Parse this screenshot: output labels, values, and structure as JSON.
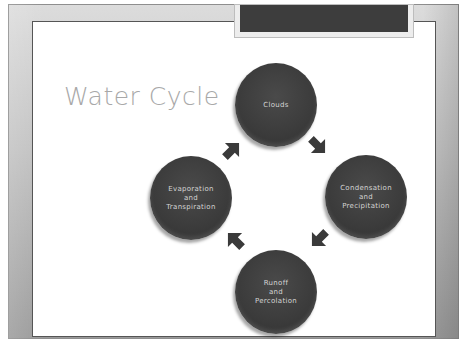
{
  "slide": {
    "title": "Water Cycle",
    "colors": {
      "frame": "#c4c4c4",
      "panel": "#ffffff",
      "tab": "#3d3d3d",
      "node_fill": "#3b3b3b",
      "node_text": "#d4d4d4",
      "arrow": "#3a3a3a",
      "title_text": "#a8a8a8"
    }
  },
  "cycle": {
    "nodes": [
      {
        "id": "clouds",
        "label": "Clouds"
      },
      {
        "id": "condensation",
        "label": "Condensation\nand\nPrecipitation"
      },
      {
        "id": "runoff",
        "label": "Runoff\nand\nPercolation"
      },
      {
        "id": "evaporation",
        "label": "Evaporation\nand\nTranspiration"
      }
    ],
    "arrows": [
      {
        "from": "Clouds",
        "to": "Condensation and Precipitation",
        "direction": "down-right"
      },
      {
        "from": "Condensation and Precipitation",
        "to": "Runoff and Percolation",
        "direction": "down-left"
      },
      {
        "from": "Runoff and Percolation",
        "to": "Evaporation and Transpiration",
        "direction": "up-left"
      },
      {
        "from": "Evaporation and Transpiration",
        "to": "Clouds",
        "direction": "up-right"
      }
    ]
  }
}
